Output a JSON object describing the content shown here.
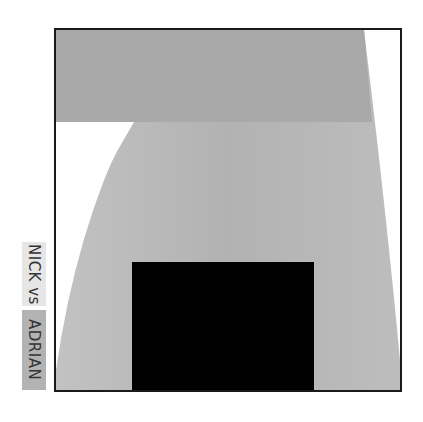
{
  "labels": {
    "first": "NICK vs",
    "second": "ADRIAN"
  },
  "colors": {
    "frame_border": "#1a1a1a",
    "top_band": "#a8a8a8",
    "body_shape": "#b0b0b0",
    "body_shape_light": "#c4c4c4",
    "background": "#ffffff",
    "black_block": "#000000",
    "label_first_bg": "#e6e6e6",
    "label_second_bg": "#b3b3b3"
  }
}
